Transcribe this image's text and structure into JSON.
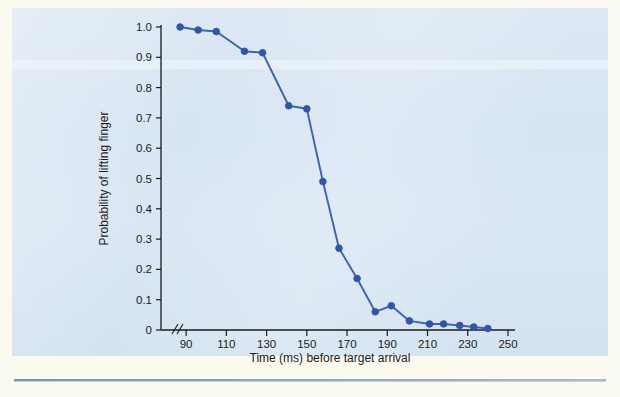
{
  "figure": {
    "background_color": "#d9e7f4",
    "paper_color": "#fbfaf0",
    "line_color": "#3a63b8",
    "marker_color": "#2f56ad",
    "axis_color": "#1b1b1b"
  },
  "chart_data": {
    "type": "line",
    "title": "",
    "xlabel": "Time (ms) before target arrival",
    "ylabel": "Probability of lifting finger",
    "xlim": [
      80,
      252
    ],
    "ylim": [
      0,
      1.0
    ],
    "grid": false,
    "legend": null,
    "axis_break_x": true,
    "xticks": [
      90,
      110,
      130,
      150,
      170,
      190,
      210,
      230,
      250
    ],
    "xticklabels": [
      "90",
      "110",
      "130",
      "150",
      "170",
      "190",
      "210",
      "230",
      "250"
    ],
    "yticks": [
      0,
      0.1,
      0.2,
      0.3,
      0.4,
      0.5,
      0.6,
      0.7,
      0.8,
      0.9,
      1.0
    ],
    "yticklabels": [
      "0",
      "0.1",
      "0.2",
      "0.3",
      "0.4",
      "0.5",
      "0.6",
      "0.7",
      "0.8",
      "0.9",
      "1.0"
    ],
    "series": [
      {
        "name": "Probability of lifting finger",
        "x": [
          87,
          96,
          105,
          119,
          128,
          141,
          150,
          158,
          166,
          175,
          184,
          192,
          201,
          211,
          218,
          226,
          233,
          240
        ],
        "y": [
          1.0,
          0.99,
          0.985,
          0.92,
          0.915,
          0.74,
          0.73,
          0.49,
          0.27,
          0.17,
          0.06,
          0.08,
          0.03,
          0.02,
          0.02,
          0.015,
          0.01,
          0.005
        ]
      }
    ]
  },
  "axis": {
    "x_label": "Time (ms) before target arrival",
    "y_label": "Probability of lifting finger"
  }
}
